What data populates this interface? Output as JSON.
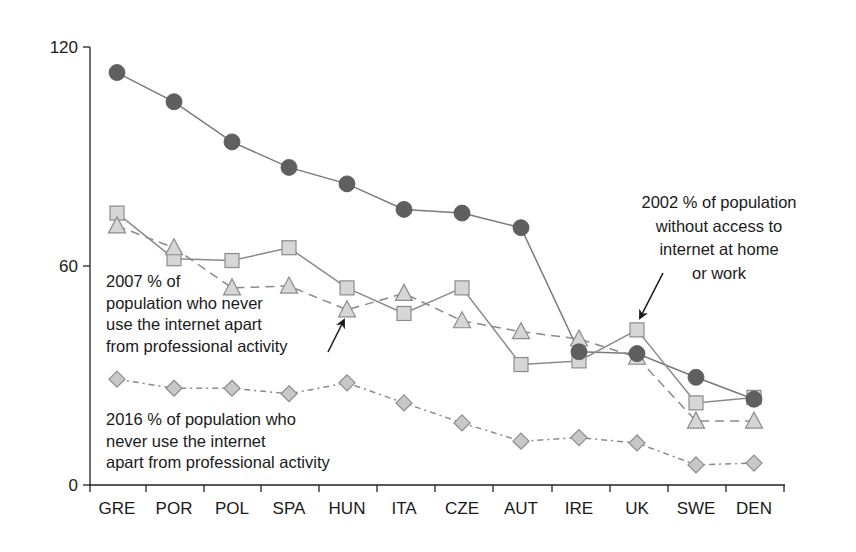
{
  "chart_data": {
    "type": "line",
    "title": "",
    "xlabel": "",
    "ylabel": "",
    "ylim": [
      0,
      120
    ],
    "yticks": [
      0,
      60,
      120
    ],
    "grid": false,
    "legend_position": "inline annotations",
    "categories": [
      "GRE",
      "POR",
      "POL",
      "SPA",
      "HUN",
      "ITA",
      "CZE",
      "AUT",
      "IRE",
      "UK",
      "SWE",
      "DEN"
    ],
    "series": [
      {
        "name": "Series (dark circles)",
        "marker": "circle",
        "line": "solid",
        "color": "#5f5f5f",
        "values": [
          113,
          105,
          94,
          87,
          82.5,
          75.5,
          74.5,
          70.5,
          36.5,
          36,
          29.5,
          23.5
        ]
      },
      {
        "name": "2002 % of population without access to internet at home or work",
        "marker": "square",
        "line": "solid",
        "color": "#d6d6d6",
        "values": [
          74.5,
          62,
          61.5,
          65,
          54,
          47,
          54,
          33,
          34,
          42.5,
          22.5,
          24
        ]
      },
      {
        "name": "2007 % of population who never use the internet apart from professional activity",
        "marker": "triangle",
        "line": "dashed",
        "color": "#d6d6d6",
        "values": [
          71,
          65,
          54,
          54.5,
          48,
          52.5,
          45,
          42,
          40,
          35,
          17.5,
          17.5
        ]
      },
      {
        "name": "2016 % of population who never use the internet apart from professional activity",
        "marker": "diamond",
        "line": "dash-dot",
        "color": "#c8c8c8",
        "values": [
          29,
          26.5,
          26.5,
          25,
          28,
          22.5,
          17,
          12,
          13,
          11.5,
          5.5,
          6
        ]
      }
    ],
    "annotations": [
      {
        "lines": [
          "2002 % of population",
          "without access to",
          "internet at home",
          "or work"
        ],
        "points_to": {
          "series": 1,
          "category": "UK"
        }
      },
      {
        "lines": [
          "2007 % of",
          "population who never",
          "use the internet apart",
          "from professional activity"
        ],
        "points_to": {
          "series": 2,
          "category": "HUN"
        }
      },
      {
        "lines": [
          "2016 % of population who",
          "never use the internet",
          "apart from professional activity"
        ],
        "points_to": null
      }
    ]
  },
  "axis": {
    "y_labels": [
      "0",
      "60",
      "120"
    ],
    "x_labels": [
      "GRE",
      "POR",
      "POL",
      "SPA",
      "HUN",
      "ITA",
      "CZE",
      "AUT",
      "IRE",
      "UK",
      "SWE",
      "DEN"
    ]
  },
  "annotation_text": {
    "a2002": [
      "2002 % of population",
      "without access to",
      "internet at home",
      "or work"
    ],
    "a2007": [
      "2007 % of",
      "population who never",
      "use the internet apart",
      "from professional activity"
    ],
    "a2016": [
      "2016 % of population who",
      "never use the internet",
      "apart from professional activity"
    ]
  }
}
